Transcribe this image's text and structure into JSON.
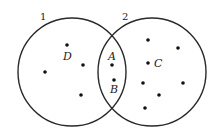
{
  "diagram": {
    "type": "venn",
    "sets": [
      {
        "id": "set-1",
        "label": "1",
        "cx": 72,
        "cy": 72,
        "r": 54,
        "label_x": 40,
        "label_y": 20
      },
      {
        "id": "set-2",
        "label": "2",
        "cx": 152,
        "cy": 72,
        "r": 54,
        "label_x": 122,
        "label_y": 20
      }
    ],
    "labeled_points": [
      {
        "name": "D",
        "x": 67,
        "y": 45,
        "label_x": 63,
        "label_y": 60,
        "region": "set-1 only"
      },
      {
        "name": "A",
        "x": 112,
        "y": 65,
        "label_x": 108,
        "label_y": 60,
        "region": "intersection"
      },
      {
        "name": "B",
        "x": 114,
        "y": 80,
        "label_x": 110,
        "label_y": 93,
        "region": "intersection"
      },
      {
        "name": "C",
        "x": 148,
        "y": 63,
        "label_x": 154,
        "label_y": 67,
        "region": "set-2 only"
      }
    ],
    "unlabeled_points": [
      {
        "x": 45,
        "y": 72,
        "region": "set-1 only"
      },
      {
        "x": 83,
        "y": 65,
        "region": "set-1 only"
      },
      {
        "x": 81,
        "y": 95,
        "region": "set-1 only"
      },
      {
        "x": 148,
        "y": 40,
        "region": "set-2 only"
      },
      {
        "x": 178,
        "y": 48,
        "region": "set-2 only"
      },
      {
        "x": 143,
        "y": 83,
        "region": "set-2 only"
      },
      {
        "x": 183,
        "y": 83,
        "region": "set-2 only"
      },
      {
        "x": 159,
        "y": 95,
        "region": "set-2 only"
      },
      {
        "x": 145,
        "y": 108,
        "region": "set-2 only"
      }
    ],
    "colors": {
      "stroke": "#2a2a2a",
      "dot": "#111111",
      "background": "#ffffff"
    }
  }
}
